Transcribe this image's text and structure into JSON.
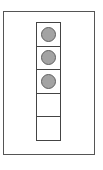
{
  "diagram": {
    "frame": {
      "border_color": "#555555"
    },
    "column": {
      "cell_count": 5,
      "cells": [
        {
          "filled": true
        },
        {
          "filled": true
        },
        {
          "filled": true
        },
        {
          "filled": false
        },
        {
          "filled": false
        }
      ],
      "filled_count": 3,
      "disc_color": "#a3a3a3",
      "border_color": "#444444"
    }
  }
}
